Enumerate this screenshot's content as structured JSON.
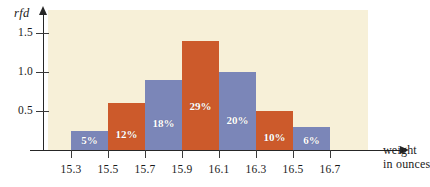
{
  "chart_data": {
    "type": "bar",
    "title": "",
    "subtitle": "",
    "xlabel_line1": "weight",
    "xlabel_line2": "in ounces",
    "ylabel": "rfd",
    "grid": false,
    "legend": "none",
    "xlim": [
      15.2,
      16.8
    ],
    "ylim": [
      0,
      1.7
    ],
    "bin_width": 0.2,
    "x_tick_labels": [
      "15.3",
      "15.5",
      "15.7",
      "15.9",
      "16.1",
      "16.3",
      "16.5",
      "16.7"
    ],
    "x_tick_values": [
      15.3,
      15.5,
      15.7,
      15.9,
      16.1,
      16.3,
      16.5,
      16.7
    ],
    "y_tick_labels": [
      "0.5",
      "1.0",
      "1.5"
    ],
    "y_tick_values": [
      0.5,
      1.0,
      1.5
    ],
    "bins": [
      {
        "left": 15.3,
        "right": 15.5,
        "percent_label": "5%",
        "percent": 5,
        "rfd": 0.25,
        "color": "#7b86b8"
      },
      {
        "left": 15.5,
        "right": 15.7,
        "percent_label": "12%",
        "percent": 12,
        "rfd": 0.6,
        "color": "#cc5a2b"
      },
      {
        "left": 15.7,
        "right": 15.9,
        "percent_label": "18%",
        "percent": 18,
        "rfd": 0.9,
        "color": "#7b86b8"
      },
      {
        "left": 15.9,
        "right": 16.1,
        "percent_label": "29%",
        "percent": 29,
        "rfd": 1.4,
        "color": "#cc5a2b"
      },
      {
        "left": 16.1,
        "right": 16.3,
        "percent_label": "20%",
        "percent": 20,
        "rfd": 1.0,
        "color": "#7b86b8"
      },
      {
        "left": 16.3,
        "right": 16.5,
        "percent_label": "10%",
        "percent": 10,
        "rfd": 0.5,
        "color": "#cc5a2b"
      },
      {
        "left": 16.5,
        "right": 16.7,
        "percent_label": "6%",
        "percent": 6,
        "rfd": 0.3,
        "color": "#7b86b8"
      }
    ],
    "colors": {
      "bar_orange": "#cc5a2b",
      "bar_blue": "#7b86b8",
      "panel_background": "#f7f0d8",
      "axis": "#262626",
      "page_background": "#ffffff",
      "bar_label_text": "#ffffff"
    }
  }
}
